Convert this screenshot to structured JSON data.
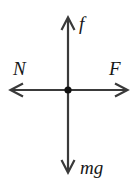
{
  "figure": {
    "background_color": "#ffffff",
    "stroke_color": "#3a3a3a",
    "label_color": "#161616",
    "origin": {
      "x": 68,
      "y": 90
    },
    "dot_radius": 3.6
  },
  "vectors": [
    {
      "name": "friction-up",
      "label": "f",
      "direction": "up",
      "tip": {
        "x": 68,
        "y": 18
      },
      "tail": {
        "x": 68,
        "y": 90
      }
    },
    {
      "name": "normal-left",
      "label": "N",
      "direction": "left",
      "tip": {
        "x": 10,
        "y": 90
      },
      "tail": {
        "x": 68,
        "y": 90
      }
    },
    {
      "name": "applied-right",
      "label": "F",
      "direction": "right",
      "tip": {
        "x": 128,
        "y": 90
      },
      "tail": {
        "x": 68,
        "y": 90
      }
    },
    {
      "name": "weight-down",
      "label": "mg",
      "direction": "down",
      "tip": {
        "x": 68,
        "y": 172
      },
      "tail": {
        "x": 68,
        "y": 90
      }
    }
  ],
  "labels": {
    "up": "f",
    "left": "N",
    "right": "F",
    "down": "mg"
  }
}
